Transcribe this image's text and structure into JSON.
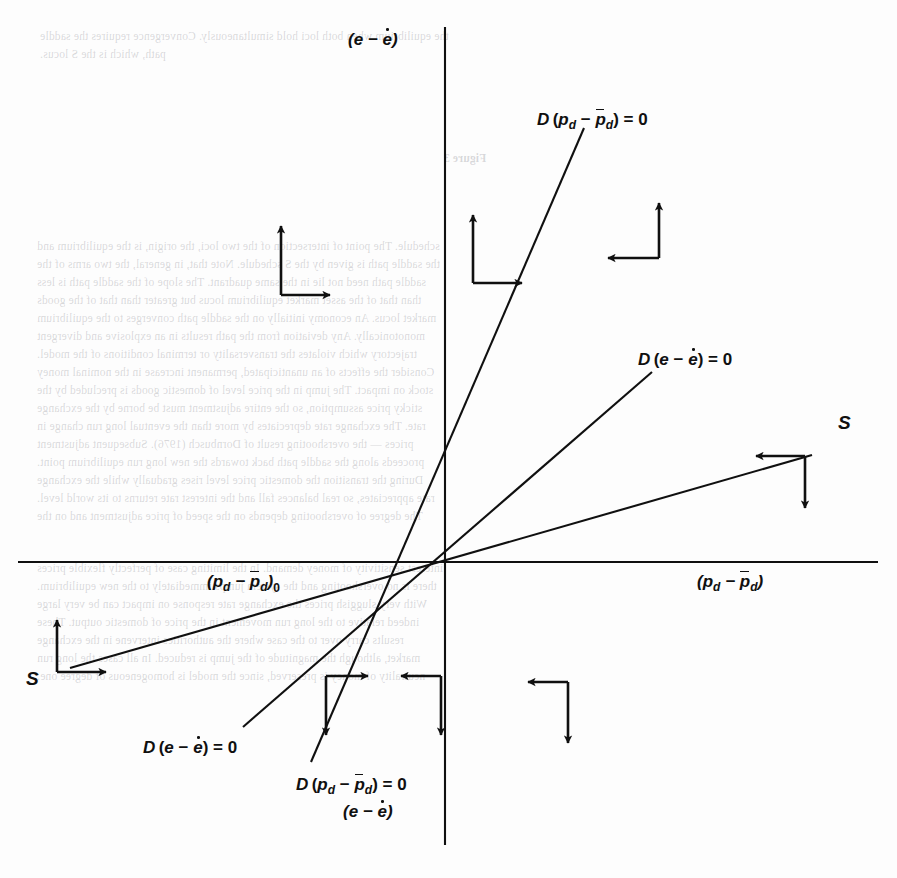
{
  "figure": {
    "type": "phase-diagram",
    "axes": {
      "y_label_top": "(e − ė)",
      "y_label_bottom": "(e − ė)",
      "x_label_left": "(pd − p̄d)0",
      "x_label_right": "(pd − p̄d)",
      "origin": {
        "x": 445,
        "y": 562
      }
    },
    "labels": {
      "locus_pd_upper": "D (pd − p̄d) = 0",
      "locus_e_upper": "D (e − ė) = 0",
      "locus_e_lower": "D (e − ė) = 0",
      "locus_pd_lower": "D (pd − p̄d) = 0",
      "saddle_right": "S",
      "saddle_left": "S"
    },
    "loci": [
      {
        "name": "D (pd - pbar_d) = 0",
        "slope_desc": "steep positive through origin",
        "p1": [
          584,
          128
        ],
        "p2": [
          311,
          762
        ]
      },
      {
        "name": "D (e - ebar) = 0",
        "slope_desc": "moderate positive through origin",
        "p1": [
          652,
          372
        ],
        "p2": [
          243,
          727
        ]
      },
      {
        "name": "S saddle path",
        "slope_desc": "shallow positive through origin",
        "p1": [
          812,
          455
        ],
        "p2": [
          70,
          668
        ]
      }
    ],
    "arrow_pairs": [
      {
        "region": "upper-left",
        "x": 285,
        "y": 258,
        "horizontal": "right",
        "vertical": "up"
      },
      {
        "region": "upper-middle",
        "x": 463,
        "y": 255,
        "horizontal": "right",
        "vertical": "up"
      },
      {
        "region": "upper-right",
        "x": 655,
        "y": 246,
        "horizontal": "left",
        "vertical": "up"
      },
      {
        "region": "right-outer",
        "x": 800,
        "y": 455,
        "horizontal": "left",
        "vertical": "down"
      },
      {
        "region": "left-outer",
        "x": 55,
        "y": 640,
        "horizontal": "right",
        "vertical": "up"
      },
      {
        "region": "lower-left",
        "x": 330,
        "y": 690,
        "horizontal": "right",
        "vertical": "down"
      },
      {
        "region": "lower-middle",
        "x": 435,
        "y": 690,
        "horizontal": "left",
        "vertical": "down"
      },
      {
        "region": "lower-right",
        "x": 570,
        "y": 690,
        "horizontal": "left",
        "vertical": "down"
      }
    ]
  },
  "page_background": {
    "top_lines": [
      "the equilibrium when both loci hold simultaneously. Convergence requires the saddle",
      "path, which is the S locus."
    ],
    "mid_heading": "Figure 3",
    "body_lines": [
      "schedule. The point of intersection of the two loci, the origin, is the equilibrium and",
      "the saddle path is given by the S schedule. Note that, in general, the two arms of the",
      "saddle path need not lie in the same quadrant. The slope of the saddle path is less",
      "than that of the asset market equilibrium locus but greater than that of the goods",
      "market locus. An economy initially on the saddle path converges to the equilibrium",
      "monotonically. Any deviation from the path results in an explosive and divergent",
      "trajectory which violates the transversality or terminal conditions of the model.",
      "Consider the effects of an unanticipated, permanent increase in the nominal money",
      "stock on impact. The jump in the price level of domestic goods is precluded by the",
      "sticky price assumption, so the entire adjustment must be borne by the exchange",
      "rate. The exchange rate depreciates by more than the eventual long run change in",
      "prices — the overshooting result of Dornbusch (1976). Subsequent adjustment",
      "proceeds along the saddle path back towards the new long run equilibrium point.",
      "During the transition the domestic price level rises gradually while the exchange",
      "rate appreciates, so real balances fall and the interest rate returns to its world level.",
      "The degree of overshooting depends on the speed of price adjustment and on the",
      "interest sensitivity of money demand. In the limiting case of perfectly flexible prices",
      "there is no overshooting and the system jumps immediately to the new equilibrium.",
      "With very sluggish prices the exchange rate response on impact can be very large",
      "indeed relative to the long run movement in the price of domestic output. These",
      "results carry over to the case where the authorities intervene in the exchange",
      "market, although the magnitude of the jump is reduced. In all cases the long run",
      "neutrality of money is preserved, since the model is homogeneous of degree one."
    ]
  }
}
